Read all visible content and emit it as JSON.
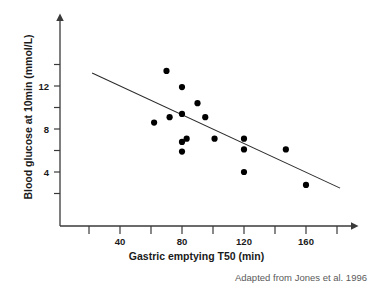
{
  "figure": {
    "source_caption": "Adapted from Jones et al. 1996"
  },
  "chart_data": {
    "type": "scatter",
    "title": "",
    "xlabel": "Gastric emptying T50 (min)",
    "ylabel": "Blood glucose at 10min (mmol/L)",
    "xlim": [
      20,
      190
    ],
    "ylim": [
      0,
      15
    ],
    "xticks": [
      40,
      80,
      120,
      160
    ],
    "xticklabels": [
      "40",
      "80",
      "120",
      "160"
    ],
    "xminor_ticks": [
      20,
      60,
      100,
      140,
      180
    ],
    "yticks": [
      4,
      8,
      12
    ],
    "yticklabels": [
      "4",
      "8",
      "12"
    ],
    "yminor_ticks": [
      2,
      6,
      10,
      14
    ],
    "grid": false,
    "legend": null,
    "points": [
      {
        "x": 62,
        "y": 8.6
      },
      {
        "x": 70,
        "y": 13.4
      },
      {
        "x": 72,
        "y": 9.1
      },
      {
        "x": 80,
        "y": 11.9
      },
      {
        "x": 80,
        "y": 9.4
      },
      {
        "x": 80,
        "y": 6.8
      },
      {
        "x": 80,
        "y": 5.9
      },
      {
        "x": 83,
        "y": 7.1
      },
      {
        "x": 90,
        "y": 10.4
      },
      {
        "x": 95,
        "y": 9.1
      },
      {
        "x": 101,
        "y": 7.1
      },
      {
        "x": 120,
        "y": 7.1
      },
      {
        "x": 120,
        "y": 6.1
      },
      {
        "x": 120,
        "y": 4.0
      },
      {
        "x": 147,
        "y": 6.1
      },
      {
        "x": 160,
        "y": 2.8
      }
    ],
    "trend_line": {
      "label": "regression line",
      "x_start": 22,
      "y_start": 13.2,
      "x_end": 182,
      "y_end": 2.5
    },
    "colors": {
      "point": "#000000",
      "line": "#2b2b2b",
      "axis": "#3a3a3a",
      "caption": "#5a5a5a"
    }
  }
}
